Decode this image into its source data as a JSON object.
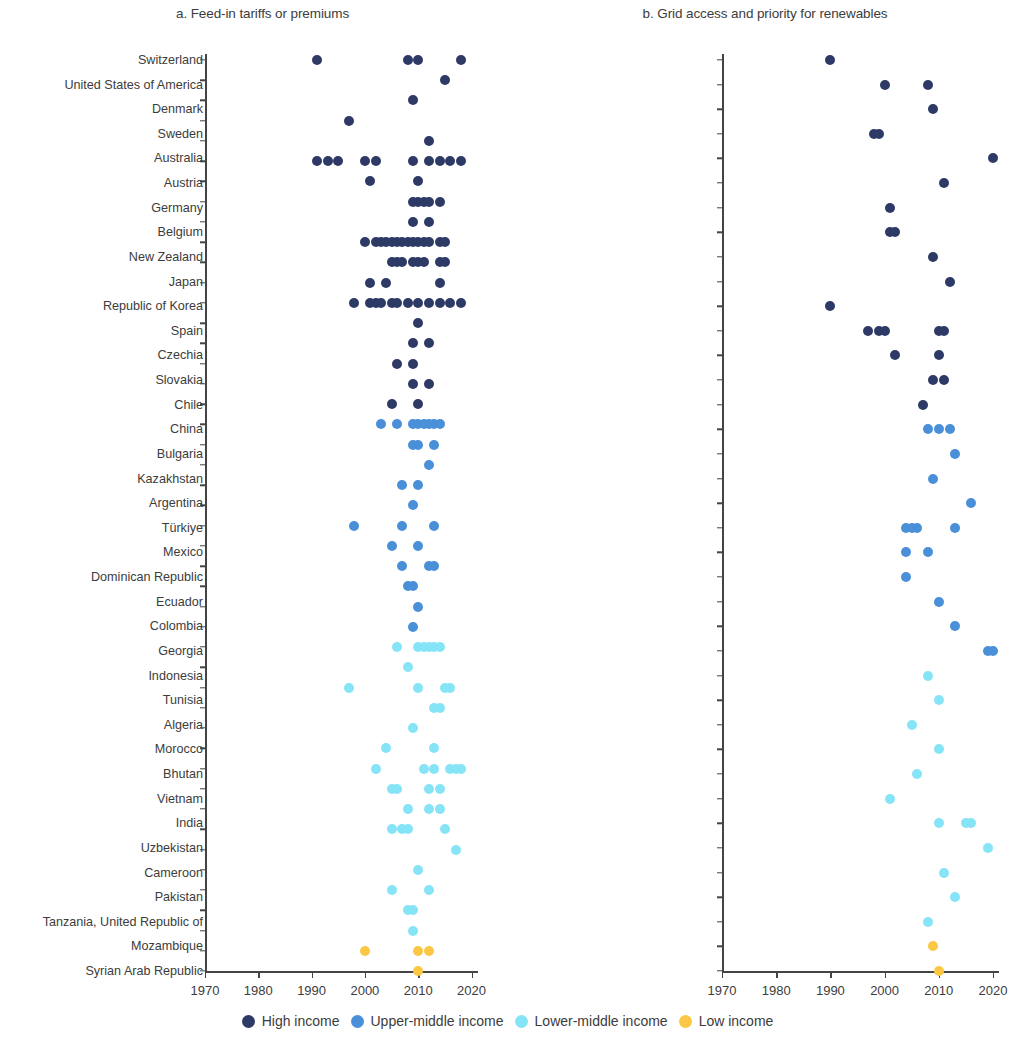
{
  "figure": {
    "legend": {
      "items": [
        {
          "label": "High income",
          "color": "#2e3a66"
        },
        {
          "label": "Upper-middle income",
          "color": "#4a90d9"
        },
        {
          "label": "Lower-middle income",
          "color": "#86e4f7"
        },
        {
          "label": "Low income",
          "color": "#fbc744"
        }
      ]
    }
  },
  "chart_data": [
    {
      "type": "scatter",
      "panel": "a",
      "title": "a. Feed-in tariffs or premiums",
      "xlabel": "",
      "ylabel": "",
      "xlim": [
        1966,
        2024
      ],
      "xticks": [
        1970,
        1980,
        1990,
        2000,
        2010,
        2020
      ],
      "xtick_labels": [
        "1970",
        "1980",
        "1990",
        "2000",
        "2010",
        "2020"
      ],
      "grid": false,
      "legend_position": "bottom",
      "categories": [
        "Switzerland",
        "United States of America",
        "Denmark",
        "Sweden",
        "Austria",
        "Germany",
        "Canada",
        "United Kingdom",
        "Japan",
        "France",
        "Italy",
        "Republic of Korea",
        "Spain",
        "Czechia",
        "Slovakia",
        "Greece",
        "Uruguay",
        "Chile",
        "China",
        "Malaysia",
        "Russian Federation",
        "Bulgaria",
        "Kazakhstan",
        "Argentina",
        "Türkiye",
        "Thailand",
        "South Africa",
        "Ecuador",
        "Tonga",
        "Indonesia",
        "El Salvador",
        "Ukraine",
        "Egypt",
        "Tunisia",
        "Algeria",
        "Vietnam",
        "Iran",
        "Nigeria",
        "India",
        "Uzbekistan",
        "Cameroon",
        "Pakistan",
        "Tanzania, United Republic of",
        "Tajikistan",
        "Uganda",
        "Syrian Arab Republic"
      ],
      "income_groups": [
        "High income",
        "High income",
        "High income",
        "High income",
        "High income",
        "High income",
        "High income",
        "High income",
        "High income",
        "High income",
        "High income",
        "High income",
        "High income",
        "High income",
        "High income",
        "High income",
        "High income",
        "High income",
        "Upper-middle income",
        "Upper-middle income",
        "Upper-middle income",
        "Upper-middle income",
        "Upper-middle income",
        "Upper-middle income",
        "Upper-middle income",
        "Upper-middle income",
        "Upper-middle income",
        "Upper-middle income",
        "Upper-middle income",
        "Lower-middle income",
        "Lower-middle income",
        "Lower-middle income",
        "Lower-middle income",
        "Lower-middle income",
        "Lower-middle income",
        "Lower-middle income",
        "Lower-middle income",
        "Lower-middle income",
        "Lower-middle income",
        "Lower-middle income",
        "Lower-middle income",
        "Lower-middle income",
        "Lower-middle income",
        "Lower-middle income",
        "Low income",
        "Low income"
      ],
      "points": [
        {
          "category": "Switzerland",
          "years": [
            1991,
            2008,
            2010,
            2018
          ]
        },
        {
          "category": "United States of America",
          "years": [
            2015
          ]
        },
        {
          "category": "Denmark",
          "years": [
            2009
          ]
        },
        {
          "category": "Sweden",
          "years": [
            1997
          ]
        },
        {
          "category": "Austria",
          "years": [
            2012
          ]
        },
        {
          "category": "Germany",
          "years": [
            1991,
            1993,
            1995,
            2000,
            2002,
            2009,
            2012,
            2014,
            2016,
            2018
          ]
        },
        {
          "category": "Canada",
          "years": [
            2001,
            2010
          ]
        },
        {
          "category": "United Kingdom",
          "years": [
            2009,
            2010,
            2011,
            2012,
            2014
          ]
        },
        {
          "category": "Japan",
          "years": [
            2009,
            2012
          ]
        },
        {
          "category": "France",
          "years": [
            2000,
            2002,
            2003,
            2004,
            2005,
            2006,
            2007,
            2008,
            2009,
            2010,
            2011,
            2012,
            2014,
            2015
          ]
        },
        {
          "category": "Italy",
          "years": [
            2005,
            2006,
            2007,
            2009,
            2010,
            2011,
            2014,
            2015
          ]
        },
        {
          "category": "Republic of Korea",
          "years": [
            2001,
            2004,
            2014
          ]
        },
        {
          "category": "Spain",
          "years": [
            1998,
            2001,
            2002,
            2003,
            2005,
            2006,
            2008,
            2010,
            2012,
            2014,
            2016,
            2018
          ]
        },
        {
          "category": "Czechia",
          "years": [
            2010
          ]
        },
        {
          "category": "Slovakia",
          "years": [
            2009,
            2012
          ]
        },
        {
          "category": "Greece",
          "years": [
            2006,
            2009
          ]
        },
        {
          "category": "Uruguay",
          "years": [
            2009,
            2012
          ]
        },
        {
          "category": "Chile",
          "years": [
            2005,
            2010
          ]
        },
        {
          "category": "China",
          "years": [
            2003,
            2006,
            2009,
            2010,
            2011,
            2012,
            2013,
            2014
          ]
        },
        {
          "category": "Malaysia",
          "years": [
            2009,
            2010,
            2013
          ]
        },
        {
          "category": "Russian Federation",
          "years": [
            2012
          ]
        },
        {
          "category": "Bulgaria",
          "years": [
            2007,
            2010
          ]
        },
        {
          "category": "Kazakhstan",
          "years": [
            2009
          ]
        },
        {
          "category": "Argentina",
          "years": [
            1998,
            2007,
            2013
          ]
        },
        {
          "category": "Türkiye",
          "years": [
            2005,
            2010
          ]
        },
        {
          "category": "Thailand",
          "years": [
            2007,
            2012,
            2013
          ]
        },
        {
          "category": "South Africa",
          "years": [
            2008,
            2009
          ]
        },
        {
          "category": "Ecuador",
          "years": [
            2010
          ]
        },
        {
          "category": "Tonga",
          "years": [
            2009
          ]
        },
        {
          "category": "Indonesia",
          "years": [
            2006,
            2010,
            2011,
            2012,
            2013,
            2014
          ]
        },
        {
          "category": "El Salvador",
          "years": [
            2008
          ]
        },
        {
          "category": "Ukraine",
          "years": [
            1997,
            2010,
            2015,
            2016
          ]
        },
        {
          "category": "Egypt",
          "years": [
            2013,
            2014
          ]
        },
        {
          "category": "Tunisia",
          "years": [
            2009
          ]
        },
        {
          "category": "Algeria",
          "years": [
            2004,
            2013
          ]
        },
        {
          "category": "Vietnam",
          "years": [
            2002,
            2011,
            2013,
            2016,
            2017,
            2018
          ]
        },
        {
          "category": "Iran",
          "years": [
            2005,
            2006,
            2012,
            2014
          ]
        },
        {
          "category": "Nigeria",
          "years": [
            2008,
            2012,
            2014
          ]
        },
        {
          "category": "India",
          "years": [
            2005,
            2007,
            2008,
            2015
          ]
        },
        {
          "category": "Uzbekistan",
          "years": [
            2017
          ]
        },
        {
          "category": "Cameroon",
          "years": [
            2010
          ]
        },
        {
          "category": "Pakistan",
          "years": [
            2005,
            2012
          ]
        },
        {
          "category": "Tanzania, United Republic of",
          "years": [
            2008,
            2009
          ]
        },
        {
          "category": "Tajikistan",
          "years": [
            2009
          ]
        },
        {
          "category": "Uganda",
          "years": [
            2000,
            2010,
            2012
          ]
        },
        {
          "category": "Syrian Arab Republic",
          "years": [
            2010
          ]
        }
      ]
    },
    {
      "type": "scatter",
      "panel": "b",
      "title": "b. Grid access and priority for renewables",
      "xlabel": "",
      "ylabel": "",
      "xlim": [
        1966,
        2024
      ],
      "xticks": [
        1970,
        1980,
        1990,
        2000,
        2010,
        2020
      ],
      "xtick_labels": [
        "1970",
        "1980",
        "1990",
        "2000",
        "2010",
        "2020"
      ],
      "grid": false,
      "legend_position": "bottom",
      "categories": [
        "Switzerland",
        "United States of America",
        "Denmark",
        "Sweden",
        "Australia",
        "Austria",
        "Germany",
        "Belgium",
        "New Zealand",
        "Japan",
        "Republic of Korea",
        "Spain",
        "Czechia",
        "Slovakia",
        "Chile",
        "China",
        "Bulgaria",
        "Kazakhstan",
        "Argentina",
        "Türkiye",
        "Mexico",
        "Dominican Republic",
        "Ecuador",
        "Colombia",
        "Georgia",
        "Indonesia",
        "Tunisia",
        "Algeria",
        "Morocco",
        "Bhutan",
        "Vietnam",
        "India",
        "Uzbekistan",
        "Cameroon",
        "Pakistan",
        "Tanzania, United Republic of",
        "Mozambique",
        "Syrian Arab Republic"
      ],
      "income_groups": [
        "High income",
        "High income",
        "High income",
        "High income",
        "High income",
        "High income",
        "High income",
        "High income",
        "High income",
        "High income",
        "High income",
        "High income",
        "High income",
        "High income",
        "High income",
        "Upper-middle income",
        "Upper-middle income",
        "Upper-middle income",
        "Upper-middle income",
        "Upper-middle income",
        "Upper-middle income",
        "Upper-middle income",
        "Upper-middle income",
        "Upper-middle income",
        "Upper-middle income",
        "Lower-middle income",
        "Lower-middle income",
        "Lower-middle income",
        "Lower-middle income",
        "Lower-middle income",
        "Lower-middle income",
        "Lower-middle income",
        "Lower-middle income",
        "Lower-middle income",
        "Lower-middle income",
        "Lower-middle income",
        "Low income",
        "Low income"
      ],
      "points": [
        {
          "category": "Switzerland",
          "years": [
            1990
          ]
        },
        {
          "category": "United States of America",
          "years": [
            2000,
            2008
          ]
        },
        {
          "category": "Denmark",
          "years": [
            2009
          ]
        },
        {
          "category": "Sweden",
          "years": [
            1998,
            1999
          ]
        },
        {
          "category": "Australia",
          "years": [
            2020
          ]
        },
        {
          "category": "Austria",
          "years": [
            2011
          ]
        },
        {
          "category": "Germany",
          "years": [
            2001
          ]
        },
        {
          "category": "Belgium",
          "years": [
            2001,
            2002
          ]
        },
        {
          "category": "New Zealand",
          "years": [
            2009
          ]
        },
        {
          "category": "Japan",
          "years": [
            2012
          ]
        },
        {
          "category": "Republic of Korea",
          "years": [
            1990
          ]
        },
        {
          "category": "Spain",
          "years": [
            1997,
            1999,
            2000,
            2010,
            2011
          ]
        },
        {
          "category": "Czechia",
          "years": [
            2002,
            2010
          ]
        },
        {
          "category": "Slovakia",
          "years": [
            2009,
            2011
          ]
        },
        {
          "category": "Chile",
          "years": [
            2007
          ]
        },
        {
          "category": "China",
          "years": [
            2008,
            2010,
            2012
          ]
        },
        {
          "category": "Bulgaria",
          "years": [
            2013
          ]
        },
        {
          "category": "Kazakhstan",
          "years": [
            2009
          ]
        },
        {
          "category": "Argentina",
          "years": [
            2016
          ]
        },
        {
          "category": "Türkiye",
          "years": [
            2004,
            2005,
            2006,
            2013
          ]
        },
        {
          "category": "Mexico",
          "years": [
            2004,
            2008
          ]
        },
        {
          "category": "Dominican Republic",
          "years": [
            2004
          ]
        },
        {
          "category": "Ecuador",
          "years": [
            2010
          ]
        },
        {
          "category": "Colombia",
          "years": [
            2013
          ]
        },
        {
          "category": "Georgia",
          "years": [
            2019,
            2020
          ]
        },
        {
          "category": "Indonesia",
          "years": [
            2008
          ]
        },
        {
          "category": "Tunisia",
          "years": [
            2010
          ]
        },
        {
          "category": "Algeria",
          "years": [
            2005
          ]
        },
        {
          "category": "Morocco",
          "years": [
            2010
          ]
        },
        {
          "category": "Bhutan",
          "years": [
            2006
          ]
        },
        {
          "category": "Vietnam",
          "years": [
            2001
          ]
        },
        {
          "category": "India",
          "years": [
            2010,
            2015,
            2016
          ]
        },
        {
          "category": "Uzbekistan",
          "years": [
            2019
          ]
        },
        {
          "category": "Cameroon",
          "years": [
            2011
          ]
        },
        {
          "category": "Pakistan",
          "years": [
            2013
          ]
        },
        {
          "category": "Tanzania, United Republic of",
          "years": [
            2008
          ]
        },
        {
          "category": "Mozambique",
          "years": [
            2009
          ]
        },
        {
          "category": "Syrian Arab Republic",
          "years": [
            2010
          ]
        }
      ]
    }
  ]
}
